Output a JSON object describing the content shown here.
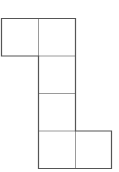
{
  "diagram": {
    "title": "",
    "type": "cube-net",
    "square_size": 37,
    "outer_stroke_color": "#555555",
    "inner_stroke_color": "#9a9a9a",
    "squares": [
      {
        "id": "face-1",
        "row": 0,
        "col": 0,
        "x": 1.5,
        "y": 18.5
      },
      {
        "id": "face-2",
        "row": 0,
        "col": 1,
        "x": 38.5,
        "y": 18.5
      },
      {
        "id": "face-3",
        "row": 1,
        "col": 1,
        "x": 38.5,
        "y": 56
      },
      {
        "id": "face-4",
        "row": 2,
        "col": 1,
        "x": 38.5,
        "y": 93.5
      },
      {
        "id": "face-5",
        "row": 3,
        "col": 1,
        "x": 38.5,
        "y": 131
      },
      {
        "id": "face-6",
        "row": 3,
        "col": 2,
        "x": 75.5,
        "y": 131
      }
    ],
    "outline_points": "1.5,18.5 75.5,18.5 75.5,131 111.5,131 111.5,168.5 38.5,168.5 38.5,56 1.5,56",
    "inner_lines": [
      {
        "x1": 38.5,
        "y1": 18.5,
        "x2": 38.5,
        "y2": 56
      },
      {
        "x1": 38.5,
        "y1": 56,
        "x2": 75.5,
        "y2": 56
      },
      {
        "x1": 38.5,
        "y1": 93.5,
        "x2": 75.5,
        "y2": 93.5
      },
      {
        "x1": 38.5,
        "y1": 131,
        "x2": 75.5,
        "y2": 131
      },
      {
        "x1": 75.5,
        "y1": 131,
        "x2": 75.5,
        "y2": 168.5
      }
    ]
  }
}
